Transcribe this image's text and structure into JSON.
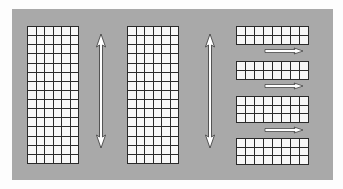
{
  "diagram": {
    "colors": {
      "background": "#fdfdfd",
      "panel": "#a9a9a9",
      "grid_fill": "#f7f7f7",
      "grid_line": "#2a2a2a",
      "arrow_fill": "#ffffff",
      "arrow_stroke": "#333333"
    },
    "tall_grids": [
      {
        "id": "grid-left",
        "x": 27,
        "y": 26,
        "cols": 6,
        "rows": 15,
        "cell_w": 8.5,
        "cell_h": 9.13
      },
      {
        "id": "grid-middle",
        "x": 127,
        "y": 26,
        "cols": 6,
        "rows": 15,
        "cell_w": 8.5,
        "cell_h": 9.13
      }
    ],
    "row_blocks": [
      {
        "id": "block-1",
        "x": 236,
        "y": 26,
        "cols": 8,
        "rows": 2,
        "cell_w": 9,
        "cell_h": 9
      },
      {
        "id": "block-2",
        "x": 236,
        "y": 61,
        "cols": 8,
        "rows": 2,
        "cell_w": 9,
        "cell_h": 9
      },
      {
        "id": "block-3",
        "x": 236,
        "y": 96,
        "cols": 8,
        "rows": 3,
        "cell_w": 9,
        "cell_h": 8.7
      },
      {
        "id": "block-4",
        "x": 236,
        "y": 138,
        "cols": 8,
        "rows": 3,
        "cell_w": 9,
        "cell_h": 8.7
      }
    ],
    "vertical_arrows": [
      {
        "id": "arrow-v-1",
        "x": 101,
        "y1": 34,
        "y2": 148,
        "direction": "both"
      },
      {
        "id": "arrow-v-2",
        "x": 210,
        "y1": 34,
        "y2": 148,
        "direction": "both"
      }
    ],
    "horizontal_arrows": [
      {
        "id": "arrow-h-1",
        "x1": 265,
        "x2": 303,
        "y": 51,
        "direction": "right"
      },
      {
        "id": "arrow-h-2",
        "x1": 265,
        "x2": 303,
        "y": 86,
        "direction": "right"
      },
      {
        "id": "arrow-h-3",
        "x1": 265,
        "x2": 303,
        "y": 130,
        "direction": "right"
      }
    ]
  }
}
